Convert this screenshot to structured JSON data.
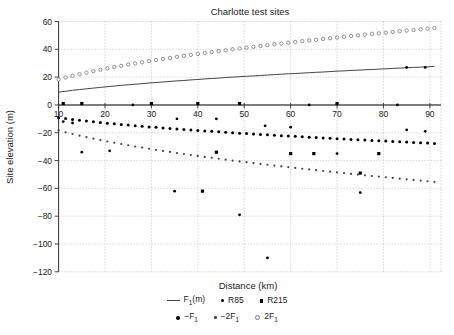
{
  "chart_data": {
    "type": "line+scatter",
    "title": "Charlotte test sites",
    "xlabel": "Distance (km)",
    "ylabel": "Site elevation (m)",
    "xlim": [
      10,
      92.4
    ],
    "ylim": [
      -120,
      60
    ],
    "grid": "dotted",
    "legend_position": "below",
    "xticks": {
      "values": [
        10,
        20,
        30,
        40,
        50,
        60,
        70,
        80,
        90
      ],
      "labels": [
        "10",
        "20",
        "30",
        "40",
        "50",
        "60",
        "70",
        "80",
        "90"
      ]
    },
    "yticks": {
      "values": [
        60,
        40,
        20,
        0,
        -20,
        -40,
        -60,
        -80,
        -100,
        -120
      ],
      "labels": [
        "60",
        "40",
        "20",
        "0",
        "−20",
        "−40",
        "−60",
        "−80",
        "−100",
        "−120"
      ]
    },
    "x_dense": [
      10,
      11.5,
      13,
      14.5,
      16,
      17.5,
      19,
      20.5,
      22,
      23.5,
      25,
      26.5,
      28,
      29.5,
      31,
      32.5,
      34,
      35.5,
      37,
      38.5,
      40,
      41.5,
      43,
      44.5,
      46,
      47.5,
      49,
      50.5,
      52,
      53.5,
      55,
      56.5,
      58,
      59.5,
      61,
      62.5,
      64,
      65.5,
      67,
      68.5,
      70,
      71.5,
      73,
      74.5,
      76,
      77.5,
      79,
      80.5,
      82,
      83.5,
      85,
      86.5,
      88,
      89.5,
      91
    ],
    "dense_y": {
      "F1": [
        9.2,
        9.8,
        10.5,
        11.0,
        11.6,
        12.1,
        12.6,
        13.1,
        13.6,
        14.1,
        14.5,
        14.9,
        15.3,
        15.8,
        16.1,
        16.5,
        16.9,
        17.3,
        17.6,
        18.0,
        18.3,
        18.7,
        19.0,
        19.3,
        19.7,
        20.0,
        20.3,
        20.6,
        20.9,
        21.2,
        21.5,
        21.8,
        22.1,
        22.4,
        22.6,
        22.9,
        23.2,
        23.5,
        23.7,
        24.0,
        24.3,
        24.5,
        24.8,
        25.0,
        25.3,
        25.5,
        25.8,
        26.0,
        26.3,
        26.5,
        26.7,
        27.0,
        27.2,
        27.4,
        27.7
      ],
      "twoF1": [
        18.3,
        19.7,
        20.9,
        22.1,
        23.2,
        24.3,
        25.3,
        26.3,
        27.2,
        28.1,
        29.0,
        29.9,
        30.7,
        31.5,
        32.3,
        33.1,
        33.8,
        34.6,
        35.3,
        36.0,
        36.7,
        37.4,
        38.0,
        38.7,
        39.3,
        40.0,
        40.6,
        41.2,
        41.8,
        42.4,
        43.0,
        43.6,
        44.2,
        44.7,
        45.3,
        45.9,
        46.4,
        46.9,
        47.5,
        48.0,
        48.5,
        49.0,
        49.6,
        50.1,
        50.6,
        51.1,
        51.5,
        52.0,
        52.5,
        53.0,
        53.5,
        53.9,
        54.4,
        54.9,
        55.3
      ],
      "negF1": [
        -9.2,
        -9.8,
        -10.5,
        -11.0,
        -11.6,
        -12.1,
        -12.6,
        -13.1,
        -13.6,
        -14.1,
        -14.5,
        -14.9,
        -15.3,
        -15.8,
        -16.1,
        -16.5,
        -16.9,
        -17.3,
        -17.6,
        -18.0,
        -18.3,
        -18.7,
        -19.0,
        -19.3,
        -19.7,
        -20.0,
        -20.3,
        -20.6,
        -20.9,
        -21.2,
        -21.5,
        -21.8,
        -22.1,
        -22.4,
        -22.6,
        -22.9,
        -23.2,
        -23.5,
        -23.7,
        -24.0,
        -24.3,
        -24.5,
        -24.8,
        -25.0,
        -25.3,
        -25.5,
        -25.8,
        -26.0,
        -26.3,
        -26.5,
        -26.7,
        -27.0,
        -27.2,
        -27.4,
        -27.7
      ],
      "neg2F1": [
        -18.3,
        -19.7,
        -20.9,
        -22.1,
        -23.2,
        -24.3,
        -25.3,
        -26.3,
        -27.2,
        -28.1,
        -29.0,
        -29.9,
        -30.7,
        -31.5,
        -32.3,
        -33.1,
        -33.8,
        -34.6,
        -35.3,
        -36.0,
        -36.7,
        -37.4,
        -38.0,
        -38.7,
        -39.3,
        -40.0,
        -40.6,
        -41.2,
        -41.8,
        -42.4,
        -43.0,
        -43.6,
        -44.2,
        -44.7,
        -45.3,
        -45.9,
        -46.4,
        -46.9,
        -47.5,
        -48.0,
        -48.5,
        -49.0,
        -49.6,
        -50.1,
        -50.6,
        -51.1,
        -51.5,
        -52.0,
        -52.5,
        -53.0,
        -53.5,
        -53.9,
        -54.4,
        -54.9,
        -55.3
      ]
    },
    "series": [
      {
        "name": "F1(m)",
        "type": "line",
        "color": "#444",
        "y_ref": "F1"
      },
      {
        "name": "2F1",
        "type": "scatter",
        "marker": "circle-open",
        "color": "#777",
        "y_ref": "twoF1"
      },
      {
        "name": "-F1",
        "type": "scatter",
        "marker": "dot-med",
        "color": "#000",
        "y_ref": "negF1"
      },
      {
        "name": "-2F1",
        "type": "scatter",
        "marker": "dot-small",
        "color": "#444",
        "y_ref": "neg2F1"
      },
      {
        "name": "R85",
        "type": "scatter",
        "marker": "dot",
        "color": "#000",
        "points": [
          [
            26,
            0
          ],
          [
            64,
            0
          ],
          [
            83,
            0
          ],
          [
            11,
            -12
          ],
          [
            13,
            -13
          ],
          [
            35.5,
            -10
          ],
          [
            44,
            -10
          ],
          [
            54.5,
            -15
          ],
          [
            60,
            -16
          ],
          [
            85,
            -18
          ],
          [
            89,
            -19
          ],
          [
            15,
            -34
          ],
          [
            21,
            -33
          ],
          [
            70,
            -35
          ],
          [
            35,
            -62
          ],
          [
            75,
            -63
          ],
          [
            49,
            -79
          ],
          [
            55,
            -110
          ],
          [
            85,
            27
          ],
          [
            89,
            27
          ]
        ]
      },
      {
        "name": "R215",
        "type": "scatter",
        "marker": "square",
        "color": "#000",
        "points": [
          [
            11,
            1
          ],
          [
            15,
            1
          ],
          [
            30,
            1
          ],
          [
            40,
            1
          ],
          [
            49,
            1
          ],
          [
            70,
            1
          ],
          [
            44,
            -34
          ],
          [
            60,
            -35
          ],
          [
            65,
            -35
          ],
          [
            79,
            -35
          ],
          [
            75,
            -49
          ],
          [
            41,
            -62
          ]
        ]
      }
    ]
  },
  "legend": {
    "rows": [
      [
        {
          "key": "f1m",
          "marker": "line",
          "pre": "F",
          "sub": "1",
          "post": "(m)"
        },
        {
          "key": "r85",
          "marker": "dot",
          "pre": "R85"
        },
        {
          "key": "r215",
          "marker": "square",
          "pre": "R215"
        }
      ],
      [
        {
          "key": "neg-f1",
          "marker": "dot-med",
          "pre": "−F",
          "sub": "1"
        },
        {
          "key": "neg-2f1",
          "marker": "dot-small",
          "pre": "−2F",
          "sub": "1"
        },
        {
          "key": "2f1",
          "marker": "circle-open",
          "pre": "2F",
          "sub": "1"
        }
      ]
    ]
  }
}
